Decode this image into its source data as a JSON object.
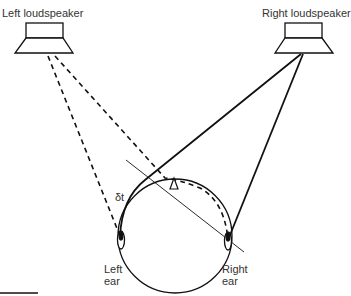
{
  "labels": {
    "left_speaker": "Left loudspeaker",
    "right_speaker": "Right loudspeaker",
    "delta_t": "δt",
    "left_ear_line1": "Left",
    "left_ear_line2": "ear",
    "right_ear_line1": "Right",
    "right_ear_line2": "ear"
  },
  "colors": {
    "stroke": "#111111",
    "text": "#333333",
    "background": "#ffffff"
  }
}
